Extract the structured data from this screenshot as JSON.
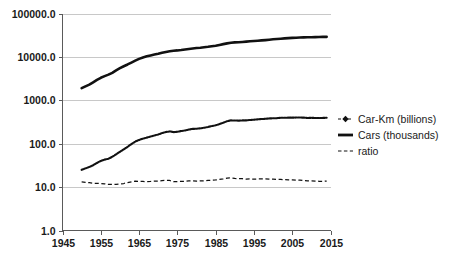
{
  "chart_data": {
    "type": "line",
    "title": "",
    "subtitle": "",
    "xlabel": "",
    "ylabel": "",
    "yscale": "log",
    "ylim": [
      1.0,
      100000.0
    ],
    "xlim": [
      1945,
      2015
    ],
    "grid": true,
    "legend_position": "right",
    "y_ticks": [
      "100000.0",
      "10000.0",
      "1000.0",
      "100.0",
      "10.0",
      "1.0"
    ],
    "y_tick_values": [
      100000.0,
      10000.0,
      1000.0,
      100.0,
      10.0,
      1.0
    ],
    "x_ticks": [
      "1945",
      "1955",
      "1965",
      "1975",
      "1985",
      "1995",
      "2005",
      "2015"
    ],
    "x_tick_values": [
      1945,
      1955,
      1965,
      1975,
      1985,
      1995,
      2005,
      2015
    ],
    "x": [
      1950,
      1951,
      1952,
      1953,
      1954,
      1955,
      1956,
      1957,
      1958,
      1959,
      1960,
      1961,
      1962,
      1963,
      1964,
      1965,
      1966,
      1967,
      1968,
      1969,
      1970,
      1971,
      1972,
      1973,
      1974,
      1975,
      1976,
      1977,
      1978,
      1979,
      1980,
      1981,
      1982,
      1983,
      1984,
      1985,
      1986,
      1987,
      1988,
      1989,
      1990,
      1991,
      1992,
      1993,
      1994,
      1995,
      1996,
      1997,
      1998,
      1999,
      2000,
      2001,
      2002,
      2003,
      2004,
      2005,
      2006,
      2007,
      2008,
      2009,
      2010,
      2011,
      2012,
      2013,
      2014
    ],
    "series": [
      {
        "name": "Car-Km (billions)",
        "marker": "diamond",
        "linestyle": "dashed-marker",
        "color": "#111111",
        "values": [
          25,
          27,
          29,
          32,
          36,
          40,
          43,
          45,
          50,
          57,
          65,
          74,
          85,
          98,
          112,
          122,
          131,
          138,
          146,
          155,
          163,
          175,
          186,
          192,
          185,
          188,
          196,
          202,
          212,
          219,
          221,
          226,
          233,
          243,
          255,
          265,
          283,
          305,
          330,
          345,
          342,
          340,
          344,
          345,
          352,
          357,
          363,
          370,
          375,
          382,
          385,
          388,
          395,
          396,
          398,
          399,
          400,
          402,
          398,
          392,
          394,
          392,
          390,
          393,
          396
        ]
      },
      {
        "name": "Cars (thousands)",
        "marker": "none",
        "linestyle": "solid",
        "color": "#111111",
        "values": [
          1900,
          2100,
          2300,
          2600,
          2950,
          3300,
          3600,
          3900,
          4300,
          4900,
          5500,
          6100,
          6700,
          7400,
          8200,
          9000,
          9700,
          10300,
          10800,
          11300,
          11800,
          12400,
          13000,
          13500,
          13900,
          14100,
          14400,
          14800,
          15200,
          15600,
          16000,
          16300,
          16700,
          17100,
          17600,
          18100,
          18900,
          19700,
          20500,
          21200,
          21600,
          21800,
          22100,
          22500,
          22900,
          23300,
          23600,
          24000,
          24400,
          24900,
          25400,
          25800,
          26200,
          26700,
          27100,
          27400,
          27700,
          28000,
          28200,
          28300,
          28400,
          28500,
          28700,
          28900,
          29000
        ]
      },
      {
        "name": "ratio",
        "marker": "none",
        "linestyle": "dashed",
        "color": "#111111",
        "values": [
          13.2,
          12.9,
          12.6,
          12.3,
          12.2,
          12.1,
          11.9,
          11.5,
          11.6,
          11.6,
          11.8,
          12.1,
          12.7,
          13.2,
          13.7,
          13.6,
          13.5,
          13.4,
          13.5,
          13.7,
          13.8,
          14.1,
          14.3,
          14.2,
          13.3,
          13.3,
          13.6,
          13.6,
          13.9,
          14.0,
          13.8,
          13.9,
          13.9,
          14.2,
          14.5,
          14.6,
          15.0,
          15.5,
          16.1,
          16.3,
          15.8,
          15.6,
          15.6,
          15.3,
          15.4,
          15.3,
          15.4,
          15.4,
          15.4,
          15.3,
          15.2,
          15.0,
          15.1,
          14.8,
          14.7,
          14.6,
          14.5,
          14.4,
          14.1,
          13.9,
          13.9,
          13.8,
          13.6,
          13.6,
          13.7
        ]
      }
    ],
    "legend": [
      {
        "label": "Car-Km (billions)",
        "style": "dashed-marker"
      },
      {
        "label": "Cars (thousands)",
        "style": "solid"
      },
      {
        "label": "ratio",
        "style": "dashed"
      }
    ]
  },
  "colors": {
    "series": "#111111",
    "grid": "#c8c8c8",
    "axis": "#5a5a5a",
    "background": "#ffffff",
    "text": "#1a1a1a"
  }
}
